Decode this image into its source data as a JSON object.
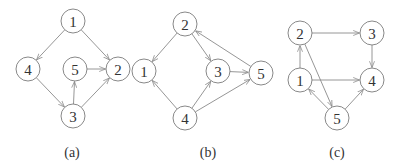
{
  "graphs": [
    {
      "id": "a",
      "caption": "(a)",
      "caption_pos": [
        72,
        157
      ],
      "nodes": [
        {
          "label": "1",
          "x": 73,
          "y": 21
        },
        {
          "label": "4",
          "x": 28,
          "y": 69
        },
        {
          "label": "5",
          "x": 75,
          "y": 69
        },
        {
          "label": "2",
          "x": 118,
          "y": 69
        },
        {
          "label": "3",
          "x": 73,
          "y": 116
        }
      ],
      "edges": [
        {
          "from": "1",
          "to": "4"
        },
        {
          "from": "1",
          "to": "2"
        },
        {
          "from": "5",
          "to": "2"
        },
        {
          "from": "4",
          "to": "3"
        },
        {
          "from": "3",
          "to": "5"
        },
        {
          "from": "3",
          "to": "2"
        }
      ]
    },
    {
      "id": "b",
      "caption": "(b)",
      "caption_pos": [
        208,
        157
      ],
      "nodes": [
        {
          "label": "2",
          "x": 185,
          "y": 24
        },
        {
          "label": "1",
          "x": 144,
          "y": 71
        },
        {
          "label": "3",
          "x": 218,
          "y": 71
        },
        {
          "label": "5",
          "x": 261,
          "y": 73
        },
        {
          "label": "4",
          "x": 185,
          "y": 118
        }
      ],
      "edges": [
        {
          "from": "2",
          "to": "1"
        },
        {
          "from": "2",
          "to": "3"
        },
        {
          "from": "5",
          "to": "2"
        },
        {
          "from": "3",
          "to": "5"
        },
        {
          "from": "4",
          "to": "1"
        },
        {
          "from": "4",
          "to": "3"
        },
        {
          "from": "4",
          "to": "5"
        }
      ]
    },
    {
      "id": "c",
      "caption": "(c)",
      "caption_pos": [
        337,
        157
      ],
      "nodes": [
        {
          "label": "2",
          "x": 300,
          "y": 33
        },
        {
          "label": "3",
          "x": 372,
          "y": 33
        },
        {
          "label": "1",
          "x": 300,
          "y": 80
        },
        {
          "label": "4",
          "x": 372,
          "y": 80
        },
        {
          "label": "5",
          "x": 337,
          "y": 118
        }
      ],
      "edges": [
        {
          "from": "2",
          "to": "3"
        },
        {
          "from": "3",
          "to": "4"
        },
        {
          "from": "1",
          "to": "2"
        },
        {
          "from": "1",
          "to": "4"
        },
        {
          "from": "2",
          "to": "5"
        },
        {
          "from": "5",
          "to": "1"
        },
        {
          "from": "5",
          "to": "4"
        }
      ]
    }
  ],
  "style": {
    "node_radius": 12,
    "edge_color": "#8a8a8a",
    "node_stroke": "#7a7a7a",
    "text_color": "#333333"
  }
}
